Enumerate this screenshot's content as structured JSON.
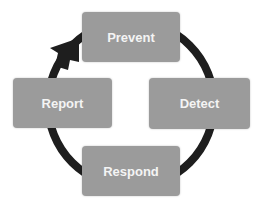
{
  "diagram": {
    "type": "cycle",
    "stages": [
      {
        "id": "prevent",
        "label": "Prevent"
      },
      {
        "id": "detect",
        "label": "Detect"
      },
      {
        "id": "respond",
        "label": "Respond"
      },
      {
        "id": "report",
        "label": "Report"
      }
    ],
    "direction": "clockwise",
    "colors": {
      "box": "#9b9b9b",
      "text": "#f4f4f4",
      "arrow": "#1e1e1e"
    }
  }
}
